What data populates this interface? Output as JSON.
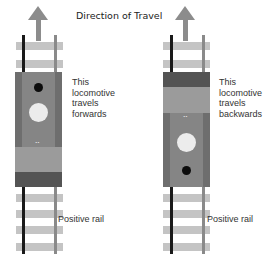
{
  "title": "Direction of Travel",
  "locomotives": [
    {
      "id": "left",
      "caption_lines": [
        "This",
        "locomotive",
        "travels",
        "forwards"
      ],
      "rail_label": "Positive rail",
      "orientation": "forwards"
    },
    {
      "id": "right",
      "caption_lines": [
        "This",
        "locomotive",
        "travels",
        "backwards"
      ],
      "rail_label": "Positive rail",
      "orientation": "backwards"
    }
  ],
  "icons": {
    "arrow": "up-arrow",
    "marks": "••"
  },
  "colors": {
    "negative_rail": "#1a1a1a",
    "positive_rail": "#8a8a8a",
    "ties": "#c4c4c4",
    "arrow": "#8c8c8c",
    "body": "#858585",
    "dark_end": "#545454",
    "headlight": "#ececec",
    "dot": "#0c0c0c"
  }
}
